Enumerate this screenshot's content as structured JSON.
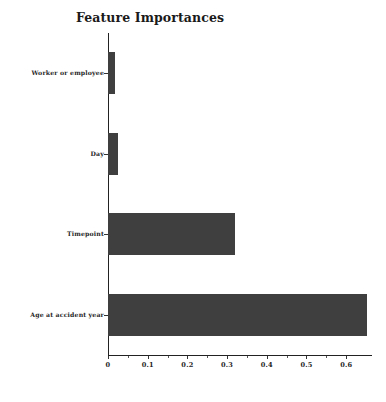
{
  "chart_data": {
    "type": "bar",
    "orientation": "horizontal",
    "title": "Feature Importances",
    "xlabel": "",
    "ylabel": "",
    "categories": [
      "Worker or employee",
      "Day",
      "Timepoint",
      "Age at accident year"
    ],
    "values": [
      0.018,
      0.025,
      0.32,
      0.652
    ],
    "xlim": [
      0,
      0.665
    ],
    "xticks": [
      "0",
      "0.1",
      "0.2",
      "0.3",
      "0.4",
      "0.5",
      "0.6"
    ],
    "xtick_values": [
      0,
      0.1,
      0.2,
      0.3,
      0.4,
      0.5,
      0.6
    ],
    "grid": false,
    "legend": null,
    "bar_color": "#3f3f3f",
    "background_color": "#ffffff"
  }
}
